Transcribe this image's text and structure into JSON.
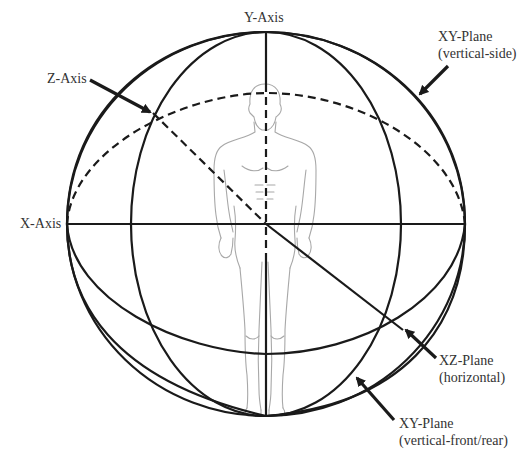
{
  "diagram": {
    "colors": {
      "line": "#1a1a1a",
      "figure": "#a8a8a8",
      "text": "#333333",
      "background": "#ffffff"
    },
    "labels": {
      "y_axis": "Y-Axis",
      "x_axis": "X-Axis",
      "z_axis": "Z-Axis",
      "xy_side": {
        "line1": "XY-Plane",
        "line2": "(vertical-side)"
      },
      "xz": {
        "line1": "XZ-Plane",
        "line2": "(horizontal)"
      },
      "xy_front": {
        "line1": "XY-Plane",
        "line2": "(vertical-front/rear)"
      }
    },
    "elements": [
      "outer sphere outline",
      "vertical-side plane ellipse",
      "vertical-front/rear plane ellipse",
      "horizontal plane ellipse (front solid, back dashed)",
      "Y axis vertical line",
      "X axis horizontal line",
      "Z axis diagonal line (back dashed, front solid)",
      "standing human figure outline"
    ]
  }
}
